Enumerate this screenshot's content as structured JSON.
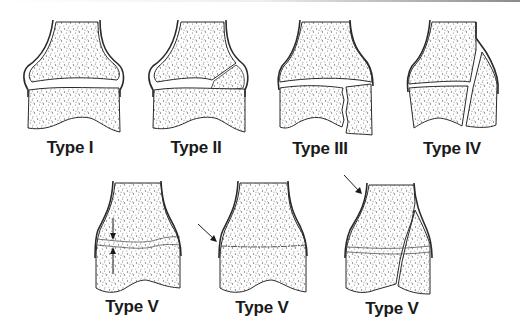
{
  "figure": {
    "panels": [
      {
        "id": "type-1",
        "label": "Type I",
        "row": 1
      },
      {
        "id": "type-2",
        "label": "Type II",
        "row": 1
      },
      {
        "id": "type-3",
        "label": "Type III",
        "row": 1
      },
      {
        "id": "type-4",
        "label": "Type IV",
        "row": 1
      },
      {
        "id": "type-5a",
        "label": "Type V",
        "row": 2
      },
      {
        "id": "type-5b",
        "label": "Type V",
        "row": 2
      },
      {
        "id": "type-5c",
        "label": "Type V",
        "row": 2
      }
    ]
  },
  "colors": {
    "outline": "#2a2a2a",
    "stipple": "#6a6a6a",
    "background": "#ffffff"
  }
}
